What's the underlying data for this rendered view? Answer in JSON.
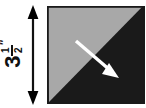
{
  "figure": {
    "background_color": "#ffffff",
    "width_px": 146,
    "height_px": 108
  },
  "dimension": {
    "name": "height-dimension",
    "whole_number": "3",
    "fraction_numerator": "1",
    "fraction_denominator": "2",
    "unit_symbol": "″",
    "full_text": "3 1/2″",
    "orientation": "vertical",
    "arrow_style": "double-headed",
    "color": "#111111"
  },
  "block": {
    "name": "square-block",
    "shape": "square",
    "border_color": "#1a1a1a",
    "diagonal": "top-right to bottom-left",
    "triangles": [
      {
        "name": "upper-left-triangle",
        "position": "upper-left",
        "fill_color": "#a8a8a8",
        "tone": "light gray"
      },
      {
        "name": "lower-right-triangle",
        "position": "lower-right",
        "fill_color": "#1a1a1a",
        "tone": "black"
      }
    ]
  },
  "direction_arrow": {
    "name": "grain-direction-arrow",
    "color": "#ffffff",
    "direction": "down-right",
    "start": {
      "x": 76,
      "y": 41
    },
    "end": {
      "x": 117,
      "y": 76
    }
  }
}
